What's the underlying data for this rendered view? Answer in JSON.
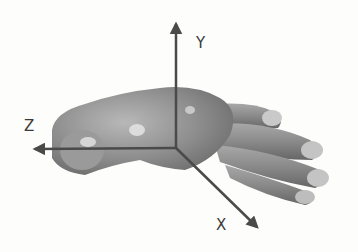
{
  "figure": {
    "axes": {
      "y": {
        "label": "Y"
      },
      "z": {
        "label": "Z"
      },
      "x": {
        "label": "X"
      }
    },
    "colors": {
      "background": "#fdfdfb",
      "hand_shade": "#8a8a8a",
      "axis": "#4a4a4a"
    }
  }
}
